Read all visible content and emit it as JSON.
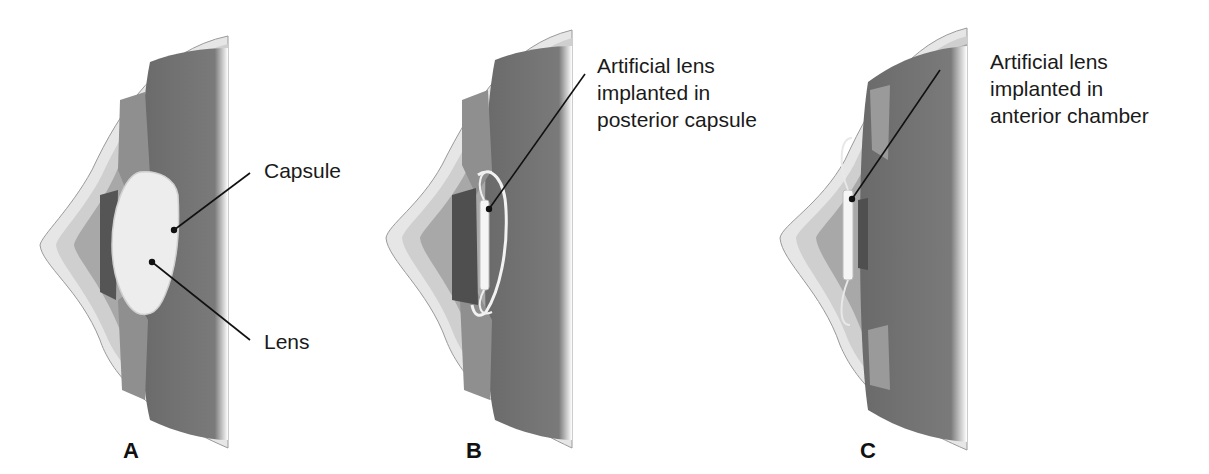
{
  "panels": [
    {
      "id": "A",
      "letter": "A",
      "description": "Natural lens within capsule",
      "callouts": [
        {
          "text": "Capsule"
        },
        {
          "text": "Lens"
        }
      ]
    },
    {
      "id": "B",
      "letter": "B",
      "description": "Artificial lens in posterior capsule",
      "callouts": [
        {
          "text": "Artificial lens\nimplanted in\nposterior capsule"
        }
      ]
    },
    {
      "id": "C",
      "letter": "C",
      "description": "Artificial lens in anterior chamber",
      "callouts": [
        {
          "text": "Artificial lens\nimplanted in\nanterior chamber"
        }
      ]
    }
  ],
  "colors": {
    "background": "#ffffff",
    "sclera_outer": "#e4e4e4",
    "cornea_band": "#c9c9c9",
    "anterior_chamber": "#a9a9a9",
    "vitreous": "#6f6f6f",
    "iris": "#555555",
    "lens": "#ececec",
    "leader_line": "#111111"
  }
}
